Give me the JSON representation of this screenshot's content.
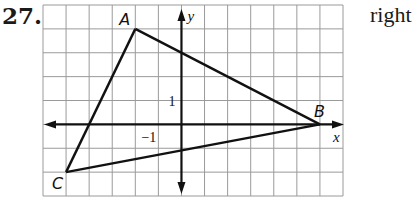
{
  "problem": {
    "number": "27.",
    "answer": "right"
  },
  "graph": {
    "x_range": [
      -6,
      7
    ],
    "y_range": [
      -3,
      5
    ],
    "x_axis_label": "x",
    "y_axis_label": "y",
    "tick_labels": [
      {
        "text": "1",
        "axis": "y",
        "value": 1
      },
      {
        "text": "−1",
        "axis": "x",
        "value": -1
      }
    ],
    "triangle": {
      "vertices": [
        {
          "label": "A",
          "x": -2,
          "y": 4
        },
        {
          "label": "B",
          "x": 6,
          "y": 0
        },
        {
          "label": "C",
          "x": -5,
          "y": -2
        }
      ]
    },
    "colors": {
      "grid": "#9a9a9a",
      "ink": "#111111"
    }
  }
}
